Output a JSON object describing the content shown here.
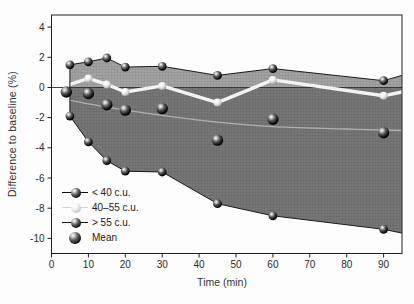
{
  "figure": {
    "y_axis_title": "Difference to baseline (%)",
    "x_axis_title": "Time (min)"
  },
  "legend": {
    "items": [
      {
        "label": "< 40 c.u.",
        "marker": "dark-sphere-on-line"
      },
      {
        "label": "40–55 c.u.",
        "marker": "light-sphere-on-line"
      },
      {
        "label": "> 55 c.u.",
        "marker": "dark-sphere-on-line"
      },
      {
        "label": "Mean",
        "marker": "large-dark-sphere"
      }
    ]
  },
  "colors": {
    "band_upper": "#a2a2a2",
    "band_lower": "#767676",
    "curve_line": "#1a1a1a",
    "mid_curve_line": "#f2f2f2",
    "trend_line": "#b8b8b8",
    "zero_line": "#2a2a2a",
    "axis": "#222222",
    "text": "#2b2b2b"
  },
  "chart_data": {
    "type": "line",
    "title": "",
    "xlabel": "Time (min)",
    "ylabel": "Difference to baseline (%)",
    "xlim": [
      0,
      95
    ],
    "ylim": [
      -11,
      4.8
    ],
    "grid": false,
    "legend_position": "lower-left-inside",
    "x_ticks": {
      "values": [
        0,
        10,
        20,
        30,
        40,
        50,
        60,
        70,
        80,
        90
      ],
      "labels": [
        "0",
        "10",
        "20",
        "30",
        "40",
        "50",
        "60",
        "70",
        "80",
        "90"
      ]
    },
    "y_ticks": {
      "values": [
        4,
        2,
        0,
        -2,
        -4,
        -6,
        -8,
        -10
      ],
      "labels": [
        "4",
        "2",
        "0",
        "-2",
        "-4",
        "-6",
        "-8",
        "-10"
      ]
    },
    "series": [
      {
        "name": "< 40 c.u.",
        "role": "upper-band-boundary",
        "marker": "dark",
        "marker_r": 4.4,
        "marker_skip": [
          8
        ],
        "x": [
          5,
          10,
          15,
          20,
          30,
          45,
          60,
          90,
          95
        ],
        "y": [
          1.5,
          1.7,
          1.95,
          1.35,
          1.4,
          0.8,
          1.25,
          0.45,
          0.8
        ]
      },
      {
        "name": "40–55 c.u.",
        "role": "middle-curve-white",
        "marker": "light",
        "marker_r": 4.0,
        "marker_skip": [
          0,
          8
        ],
        "x": [
          5,
          10,
          15,
          20,
          30,
          45,
          60,
          90,
          95
        ],
        "y": [
          0.2,
          0.6,
          0.2,
          -0.3,
          0.1,
          -1.0,
          0.5,
          -0.55,
          -0.3
        ]
      },
      {
        "name": "> 55 c.u.",
        "role": "lower-band-boundary",
        "marker": "dark",
        "marker_r": 4.4,
        "marker_skip": [
          8
        ],
        "x": [
          5,
          10,
          15,
          20,
          30,
          45,
          60,
          90,
          95
        ],
        "y": [
          -1.9,
          -3.6,
          -4.85,
          -5.55,
          -5.6,
          -7.7,
          -8.5,
          -9.4,
          -9.65
        ]
      },
      {
        "name": "Mean",
        "role": "scatter-only",
        "marker": "dark",
        "marker_r": 5.7,
        "marker_skip": [],
        "x": [
          4,
          10,
          15,
          20,
          30,
          45,
          60,
          90
        ],
        "y": [
          -0.3,
          -0.4,
          -1.15,
          -1.5,
          -1.4,
          -3.5,
          -2.1,
          -3.0
        ]
      },
      {
        "name": "Mean trend",
        "role": "smooth-trend-line",
        "marker": "none",
        "marker_r": 0,
        "marker_skip": [],
        "x": [
          5,
          15,
          30,
          45,
          60,
          80,
          95
        ],
        "y": [
          -0.85,
          -1.3,
          -1.85,
          -2.3,
          -2.6,
          -2.75,
          -2.85
        ]
      }
    ]
  }
}
